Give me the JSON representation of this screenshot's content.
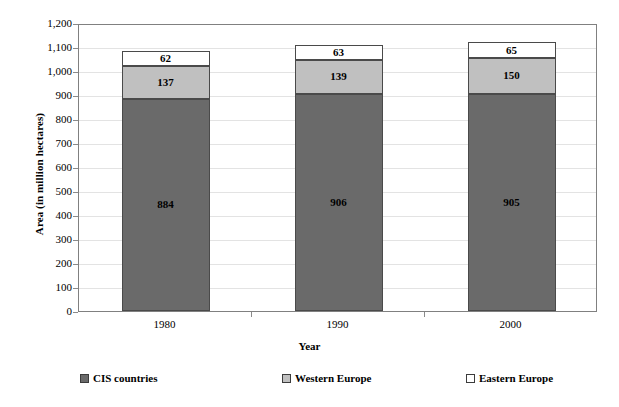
{
  "chart_data": {
    "type": "bar",
    "subtype": "stacked-bar",
    "title": "",
    "xlabel": "Year",
    "ylabel": "Area (in million hectares)",
    "categories": [
      "1980",
      "1990",
      "2000"
    ],
    "series": [
      {
        "name": "CIS countries",
        "values": [
          884,
          906,
          905
        ],
        "color": "#6a6a6a"
      },
      {
        "name": "Western Europe",
        "values": [
          137,
          139,
          150
        ],
        "color": "#c0c0c0"
      },
      {
        "name": "Eastern Europe",
        "values": [
          62,
          63,
          65
        ],
        "color": "#ffffff"
      }
    ],
    "ylim": [
      0,
      1200
    ],
    "ytick_step": 100,
    "ytick_labels": [
      "1,200",
      "1,100",
      "1,000",
      "900",
      "800",
      "700",
      "600",
      "500",
      "400",
      "300",
      "200",
      "100",
      "0"
    ],
    "grid": true,
    "grid_axis": "y",
    "legend_position": "bottom",
    "stack_order_bottom_to_top": [
      "CIS countries",
      "Western Europe",
      "Eastern Europe"
    ]
  },
  "axes": {
    "y_title": "Area (in million hectares)",
    "x_title": "Year"
  },
  "legend": {
    "items": [
      {
        "label": "CIS countries",
        "color": "#6a6a6a"
      },
      {
        "label": "Western Europe",
        "color": "#c0c0c0"
      },
      {
        "label": "Eastern Europe",
        "color": "#ffffff"
      }
    ]
  },
  "colors": {
    "cis": "#6a6a6a",
    "western": "#c0c0c0",
    "eastern": "#ffffff",
    "frame": "#808080",
    "grid": "#e3e3e3",
    "bar_outline": "#4a4a4a"
  }
}
